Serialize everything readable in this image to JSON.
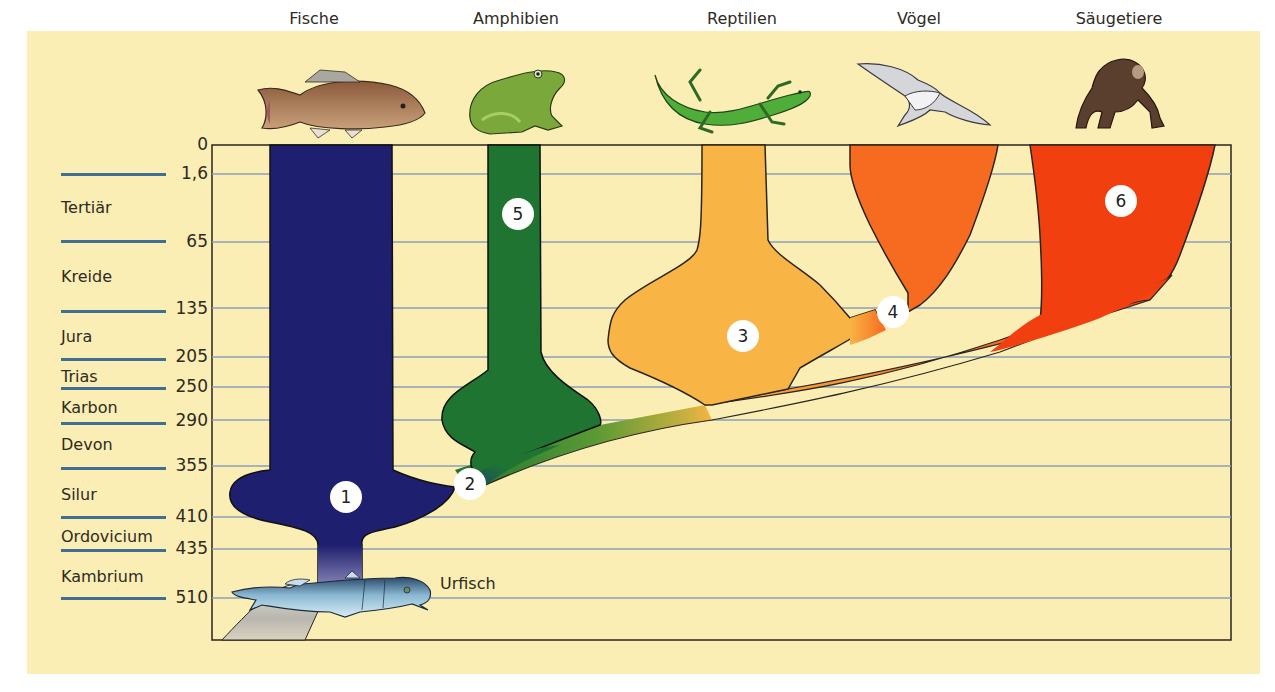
{
  "classes": [
    {
      "name": "Fische",
      "x": 314,
      "icon": "carp-fish-icon"
    },
    {
      "name": "Amphibien",
      "x": 516,
      "icon": "frog-icon"
    },
    {
      "name": "Reptilien",
      "x": 741,
      "icon": "lizard-icon"
    },
    {
      "name": "Vögel",
      "x": 920,
      "icon": "seagull-icon"
    },
    {
      "name": "Säugetiere",
      "x": 1121,
      "icon": "chimpanzee-icon"
    }
  ],
  "time_axis": {
    "unit": "Millionen Jahre",
    "ticks": [
      {
        "label": "0",
        "y": 145
      },
      {
        "label": "1,6",
        "y": 174
      },
      {
        "label": "65",
        "y": 242
      },
      {
        "label": "135",
        "y": 308
      },
      {
        "label": "205",
        "y": 357
      },
      {
        "label": "250",
        "y": 387
      },
      {
        "label": "290",
        "y": 420
      },
      {
        "label": "355",
        "y": 466
      },
      {
        "label": "410",
        "y": 517
      },
      {
        "label": "435",
        "y": 549
      },
      {
        "label": "510",
        "y": 598
      }
    ]
  },
  "periods": [
    {
      "name": "Tertiär",
      "y": 198
    },
    {
      "name": "Kreide",
      "y": 267
    },
    {
      "name": "Jura",
      "y": 327
    },
    {
      "name": "Trias",
      "y": 367
    },
    {
      "name": "Karbon",
      "y": 398
    },
    {
      "name": "Devon",
      "y": 435
    },
    {
      "name": "Silur",
      "y": 485
    },
    {
      "name": "Ordovicium",
      "y": 527
    },
    {
      "name": "Kambrium",
      "y": 567
    }
  ],
  "markers": [
    {
      "num": "1",
      "x": 346,
      "y": 497
    },
    {
      "num": "2",
      "x": 470,
      "y": 484
    },
    {
      "num": "3",
      "x": 743,
      "y": 336
    },
    {
      "num": "4",
      "x": 893,
      "y": 312
    },
    {
      "num": "5",
      "x": 518,
      "y": 214
    },
    {
      "num": "6",
      "x": 1121,
      "y": 201
    }
  ],
  "origin_label": "Urfisch",
  "colors": {
    "background": "#fbeeb4",
    "grid": "#8aa0b8",
    "fische": "#1e1f6e",
    "amphibien": "#1f7432",
    "reptilien": "#f8b444",
    "voegel": "#f66b1f",
    "saeugetiere": "#f23f10"
  }
}
